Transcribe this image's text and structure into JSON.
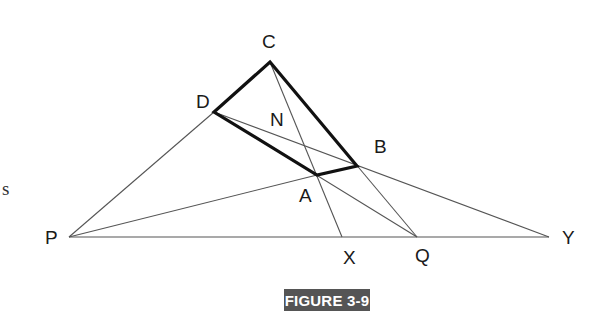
{
  "figure": {
    "caption": "FIGURE 3-9",
    "caption_bg": "#555555",
    "edge_text": "s",
    "points": {
      "C": {
        "label": "C",
        "x": 270,
        "y": 62
      },
      "D": {
        "label": "D",
        "x": 214,
        "y": 112
      },
      "N": {
        "label": "N"
      },
      "B": {
        "label": "B",
        "x": 357,
        "y": 166
      },
      "A": {
        "label": "A",
        "x": 317,
        "y": 175
      },
      "P": {
        "label": "P",
        "x": 69,
        "y": 237
      },
      "X": {
        "label": "X",
        "x": 342,
        "y": 237
      },
      "Q": {
        "label": "Q",
        "x": 417,
        "y": 237
      },
      "Y": {
        "label": "Y",
        "x": 549,
        "y": 237
      }
    },
    "quadrilateral": [
      "C",
      "B",
      "A",
      "D"
    ],
    "thin_lines": [
      [
        "P",
        "D"
      ],
      [
        "P",
        "A"
      ],
      [
        "P",
        "Y"
      ],
      [
        "D",
        "Y"
      ],
      [
        "C",
        "X"
      ],
      [
        "C",
        "Q"
      ],
      [
        "D",
        "Q"
      ]
    ]
  }
}
